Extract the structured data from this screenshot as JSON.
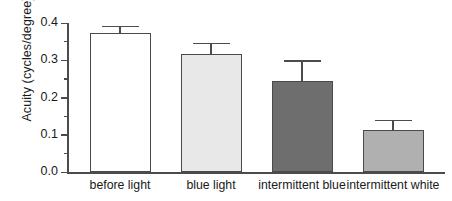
{
  "chart_data": {
    "type": "bar",
    "title": "",
    "xlabel": "",
    "ylabel": "Acuity (cycles/degree)",
    "ylim": [
      0.0,
      0.4
    ],
    "grid": false,
    "legend": "none",
    "categories": [
      "before light",
      "blue light",
      "intermittent blue",
      "intermittent white"
    ],
    "values": [
      0.372,
      0.318,
      0.245,
      0.113
    ],
    "errors": [
      0.021,
      0.029,
      0.055,
      0.027
    ],
    "bar_colors": [
      "#ffffff",
      "#e8e8e8",
      "#6e6e6e",
      "#b0b0b0"
    ],
    "bar_edge_color": "#4a4a4a",
    "axis_color": "#4c4c4c",
    "ytick_labels": [
      "0.0",
      "0.1",
      "0.2",
      "0.3",
      "0.4"
    ],
    "ytick_values": [
      0.0,
      0.1,
      0.2,
      0.3,
      0.4
    ],
    "yminor_values": [
      0.05,
      0.15,
      0.25,
      0.35
    ]
  }
}
